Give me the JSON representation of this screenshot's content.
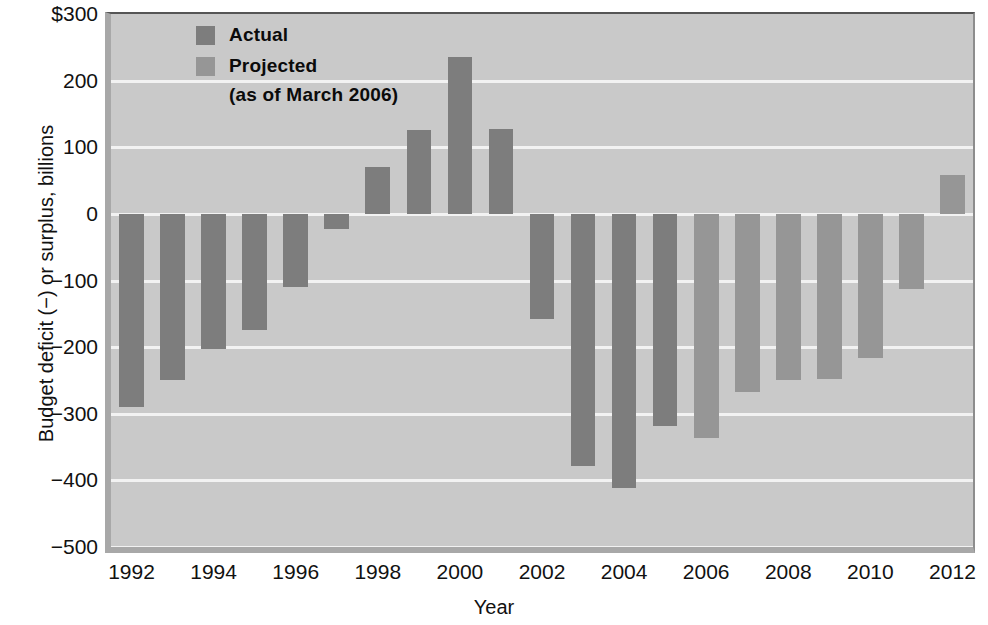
{
  "chart_data": {
    "type": "bar",
    "title": "",
    "xlabel": "Year",
    "ylabel": "Budget deficit (−) or surplus, billions",
    "ylim": [
      -500,
      300
    ],
    "grid": true,
    "legend_position": "top-left",
    "y_ticks": [
      "$300",
      "200",
      "100",
      "0",
      "−100",
      "−200",
      "−300",
      "−400",
      "−500"
    ],
    "y_tick_values": [
      300,
      200,
      100,
      0,
      -100,
      -200,
      -300,
      -400,
      -500
    ],
    "x_ticks": [
      "1992",
      "1994",
      "1996",
      "1998",
      "2000",
      "2002",
      "2004",
      "2006",
      "2008",
      "2010",
      "2012"
    ],
    "categories": [
      1992,
      1993,
      1994,
      1995,
      1996,
      1997,
      1998,
      1999,
      2000,
      2001,
      2002,
      2003,
      2004,
      2005,
      2006,
      2007,
      2008,
      2009,
      2010,
      2011,
      2012
    ],
    "values": [
      -290,
      -250,
      -203,
      -175,
      -110,
      -22,
      70,
      126,
      236,
      128,
      -158,
      -378,
      -412,
      -318,
      -336,
      -267,
      -250,
      -248,
      -216,
      -113,
      58
    ],
    "series": [
      {
        "name": "Actual",
        "kind": "actual",
        "color": "#7d7d7d",
        "points": [
          {
            "year": 1992,
            "value": -290
          },
          {
            "year": 1993,
            "value": -250
          },
          {
            "year": 1994,
            "value": -203
          },
          {
            "year": 1995,
            "value": -175
          },
          {
            "year": 1996,
            "value": -110
          },
          {
            "year": 1997,
            "value": -22
          },
          {
            "year": 1998,
            "value": 70
          },
          {
            "year": 1999,
            "value": 126
          },
          {
            "year": 2000,
            "value": 236
          },
          {
            "year": 2001,
            "value": 128
          },
          {
            "year": 2002,
            "value": -158
          },
          {
            "year": 2003,
            "value": -378
          },
          {
            "year": 2004,
            "value": -412
          },
          {
            "year": 2005,
            "value": -318
          }
        ]
      },
      {
        "name": "Projected",
        "kind": "projected",
        "color": "#969696",
        "points": [
          {
            "year": 2006,
            "value": -336
          },
          {
            "year": 2007,
            "value": -267
          },
          {
            "year": 2008,
            "value": -250
          },
          {
            "year": 2009,
            "value": -248
          },
          {
            "year": 2010,
            "value": -216
          },
          {
            "year": 2011,
            "value": -113
          },
          {
            "year": 2012,
            "value": 58
          }
        ]
      }
    ]
  },
  "legend": {
    "actual_label": "Actual",
    "projected_label": "Projected",
    "projected_note": "(as of March 2006)"
  },
  "axes": {
    "y_title": "Budget deficit (−) or surplus, billions",
    "x_title": "Year"
  },
  "colors": {
    "actual": "#7d7d7d",
    "projected": "#969696",
    "plot_background": "#c9c9c9",
    "gridline": "#f2f2f2"
  }
}
